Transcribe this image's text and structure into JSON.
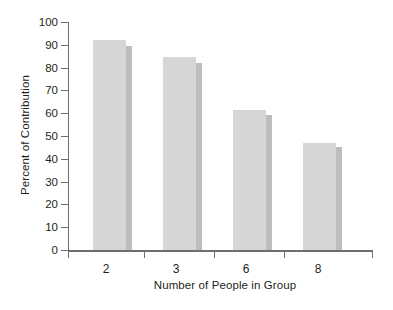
{
  "chart_data": {
    "type": "bar",
    "title": "",
    "subtitle": "",
    "xlabel": "Number of People in Group",
    "ylabel": "Percent of Contribution",
    "categories": [
      "2",
      "3",
      "6",
      "8"
    ],
    "series": [
      {
        "name": "front-face",
        "values": [
          92,
          84.5,
          61.5,
          47
        ]
      },
      {
        "name": "side-face",
        "values": [
          89.5,
          82,
          59,
          45
        ]
      }
    ],
    "values": [
      92,
      84.5,
      61.5,
      47
    ],
    "ylim": [
      0,
      100
    ],
    "y_ticks": [
      "100",
      "90",
      "80",
      "70",
      "60",
      "50",
      "40",
      "30",
      "20",
      "10",
      "0"
    ],
    "grid": false,
    "legend": "none",
    "colors": {
      "bar_front": "#d6d6d6",
      "bar_side": "#bdbdbd",
      "axis": "#6d6e70",
      "text": "#231f20",
      "background": "#ffffff"
    }
  }
}
